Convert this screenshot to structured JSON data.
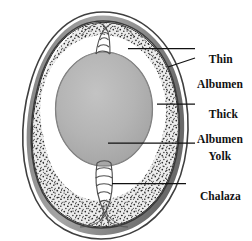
{
  "figure": {
    "background_color": "#ffffff",
    "labels": [
      {
        "id": "thin_albumen",
        "line1": "Thin",
        "line2": "Albumen"
      },
      {
        "id": "thick_albumen",
        "line1": "Thick",
        "line2": "Albumen"
      },
      {
        "id": "yolk",
        "line1": "Yolk",
        "line2": ""
      },
      {
        "id": "chalaza",
        "line1": "Chalaza",
        "line2": ""
      }
    ],
    "colors": {
      "shell_outline": "#4a4a4a",
      "shell_band": "#8b8b8b",
      "membrane_line": "#2b2b2b",
      "thick_albumen_fill": "#e8e8e8",
      "thick_albumen_stipple": "#2e2e2e",
      "thin_albumen_fill": "#ffffff",
      "yolk_fill": "#b3b3b3",
      "yolk_outline": "#6e6e6e",
      "chalaza_stroke": "#555555",
      "leader_line": "#111111",
      "text": "#111111"
    },
    "parts": {
      "shell": "egg-shell",
      "shell_membrane": "shell-membrane",
      "thick_albumen": "thick-albumen-stippled-region",
      "thin_albumen": "thin-albumen-clear-ring",
      "yolk": "yolk-oval",
      "chalaza_top": "upper-chalaza-cord",
      "chalaza_bottom": "lower-chalaza-cord"
    }
  }
}
